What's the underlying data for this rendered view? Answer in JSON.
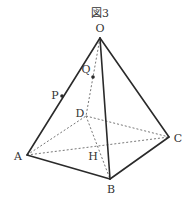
{
  "figure": {
    "title": "図3",
    "shape": "square pyramid",
    "vertices": {
      "O": {
        "label": "O",
        "x": 100,
        "y": 38
      },
      "A": {
        "label": "A",
        "x": 27,
        "y": 155
      },
      "B": {
        "label": "B",
        "x": 110,
        "y": 179
      },
      "C": {
        "label": "C",
        "x": 169,
        "y": 137
      },
      "D": {
        "label": "D",
        "x": 86,
        "y": 116
      }
    },
    "points": {
      "H": {
        "label": "H",
        "x": 98,
        "y": 146,
        "description": "intersection of diagonals AC and BD"
      },
      "P": {
        "label": "P",
        "x": 62,
        "y": 96,
        "description": "point on edge OA"
      },
      "Q": {
        "label": "Q",
        "x": 93,
        "y": 77,
        "description": "point on edge OD"
      }
    },
    "edges_solid": [
      "OA",
      "OB",
      "OC",
      "AB",
      "BC"
    ],
    "edges_dashed": [
      "OD",
      "AD",
      "DC",
      "AC",
      "BD"
    ]
  }
}
